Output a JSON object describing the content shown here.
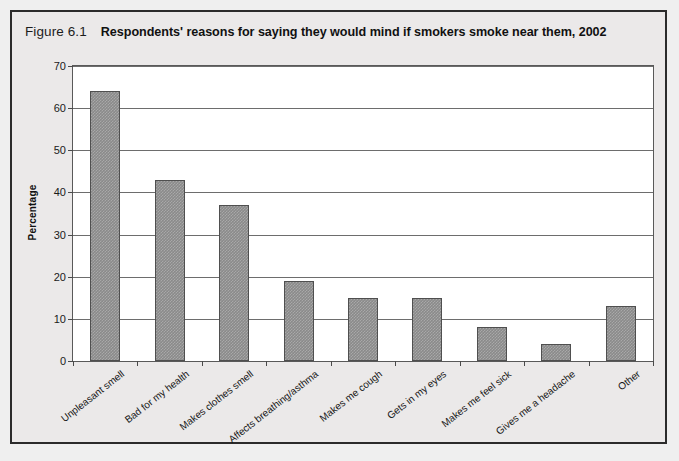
{
  "figure": {
    "number": "Figure 6.1",
    "title": "Respondents' reasons for saying they would mind if smokers smoke near them, 2002"
  },
  "chart_data": {
    "type": "bar",
    "title": "Respondents' reasons for saying they would mind if smokers smoke near them, 2002",
    "xlabel": "",
    "ylabel": "Percentage",
    "ylim": [
      0,
      70
    ],
    "yticks": [
      0,
      10,
      20,
      30,
      40,
      50,
      60,
      70
    ],
    "grid": true,
    "legend": "none",
    "bar_color": "#8a8a8a",
    "categories": [
      "Unpleasant smell",
      "Bad for my health",
      "Makes clothes smell",
      "Affects breathing/asthma",
      "Makes me cough",
      "Gets in my eyes",
      "Makes me feel sick",
      "Gives me a headache",
      "Other"
    ],
    "values": [
      64,
      43,
      37,
      19,
      15,
      15,
      8,
      4,
      13
    ]
  }
}
